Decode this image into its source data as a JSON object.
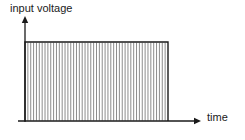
{
  "figure": {
    "title": "",
    "type": "waveform-diagram",
    "background_color": "#ffffff",
    "line_color": "#1a1a1a",
    "hatch_color": "#8c8c8c"
  },
  "axes": {
    "y_axis": {
      "label": "input voltage",
      "label_x": 10,
      "label_y": 4,
      "line_x": 25,
      "top_y": 17,
      "bottom_y": 122,
      "arrow": "up-arrow-icon"
    },
    "x_axis": {
      "label": "time",
      "label_x": 207,
      "label_y": 113,
      "line_y": 121,
      "left_x": 18,
      "right_x": 200,
      "arrow": "right-arrow-icon"
    }
  },
  "chart_data": {
    "type": "area",
    "title": "",
    "xlabel": "time",
    "ylabel": "input voltage",
    "grid": false,
    "legend": null,
    "annotations": [],
    "series": [
      {
        "name": "input voltage",
        "waveform": "chopped-square-pulse",
        "x": [
          0,
          0,
          100,
          100
        ],
        "values": [
          0,
          1,
          1,
          0
        ]
      }
    ],
    "envelope": {
      "left_x": 25,
      "right_x": 168,
      "top_y": 42,
      "baseline_y": 121
    },
    "hatch": {
      "orientation": "vertical",
      "count": 50,
      "spacing_px": 2.9,
      "stroke_width": 1
    }
  }
}
